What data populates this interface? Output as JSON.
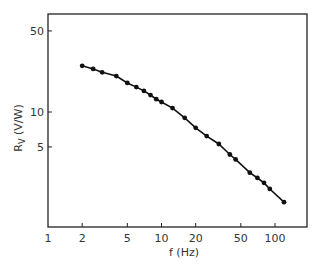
{
  "chart_data": {
    "type": "line",
    "title": "",
    "xlabel": "f (Hz)",
    "ylabel": "Rv (V/W)",
    "ylabel_main": "R",
    "ylabel_sub": "V",
    "ylabel_unit": " (V/W)",
    "xscale": "log",
    "yscale": "log",
    "xlim": [
      1,
      200
    ],
    "ylim": [
      1,
      70
    ],
    "grid": false,
    "legend": null,
    "x_ticks": [
      1,
      2,
      5,
      10,
      20,
      50,
      100
    ],
    "x_tick_labels": [
      "1",
      "2",
      "5",
      "10",
      "20",
      "50",
      "100"
    ],
    "y_ticks": [
      5,
      10,
      50
    ],
    "y_tick_labels": [
      "5",
      "10",
      "50"
    ],
    "series": [
      {
        "name": "Responsivity",
        "marker": "circle",
        "line": "solid",
        "color": "#111111",
        "x": [
          2,
          2.5,
          3,
          4,
          5,
          6,
          7,
          8,
          9,
          10,
          12.5,
          16,
          20,
          25,
          32,
          40,
          45,
          60,
          70,
          80,
          90,
          120
        ],
        "y": [
          25,
          23.5,
          22,
          20.4,
          17.8,
          16.4,
          15.2,
          14.0,
          12.9,
          12.2,
          10.8,
          8.9,
          7.3,
          6.2,
          5.3,
          4.3,
          3.9,
          3.0,
          2.7,
          2.45,
          2.17,
          1.67
        ]
      }
    ]
  }
}
